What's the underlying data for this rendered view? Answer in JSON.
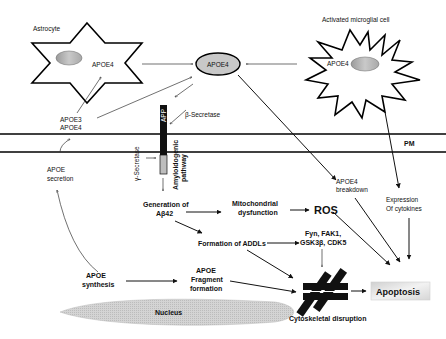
{
  "diagram": {
    "cells": {
      "astrocyte": {
        "title": "Astrocyte",
        "content": "APOE4"
      },
      "microglia": {
        "title": "Activated microglial cell",
        "content": "APOE4"
      }
    },
    "central_apoe4": "APOE4",
    "membrane_label": "PM",
    "app_label": "APP",
    "beta_secretase": "β-Secretase",
    "gamma_secretase": "γ-Secretase",
    "amyloidogenic": {
      "line1": "Amyloidogenic",
      "line2": "pathway"
    },
    "apoe3_apoe4": {
      "line1": "APOE3",
      "line2": "APOE4"
    },
    "apoe_secretion": {
      "line1": "APOE",
      "line2": "secretion"
    },
    "apoe_synthesis": {
      "line1": "APOE",
      "line2": "synthesis"
    },
    "generation_ab42": {
      "line1": "Generation of",
      "line2": "Aβ42"
    },
    "mito_dysfunction": {
      "line1": "Mitochondrial",
      "line2": "dysfunction"
    },
    "ros": "ROS",
    "formation_addls": "Formation of ADDLs",
    "kinases": {
      "line1": "Fyn, FAK1,",
      "line2": "GSK3β, CDK5"
    },
    "apoe4_breakdown": {
      "line1": "APOE4",
      "line2": "breakdown"
    },
    "cytokines": {
      "line1": "Expression",
      "line2": "Of cytokines"
    },
    "apoe_fragment": {
      "line1": "APOE",
      "line2": "Fragment",
      "line3": "formation"
    },
    "nucleus": "Nucleus",
    "cytoskeletal": "Cytoskeletal disruption",
    "apoptosis": "Apoptosis",
    "colors": {
      "line": "#111111",
      "nucleus_fill": "#cfcfcf",
      "apoe4_ellipse": "#c8c8c8",
      "apoptosis_box": "#e4e4e4",
      "app_dark": "#111111",
      "app_light": "#bdbdbd"
    }
  }
}
